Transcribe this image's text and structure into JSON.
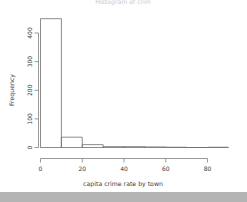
{
  "figure": {
    "background_color": "#ffffff",
    "footer_band_color": "#b4b4b4",
    "axis_color": "#808080",
    "bar_outline_color": "#6e6e6e",
    "title_clipped": "Histogram of crim"
  },
  "chart_data": {
    "type": "bar",
    "title": "Histogram of crim",
    "xlabel": "capita crime rate by town",
    "ylabel": "Frequency",
    "grid": false,
    "legend": null,
    "bin_width": 10,
    "xlim": [
      0,
      90
    ],
    "ylim": [
      0,
      460
    ],
    "xticks": [
      0,
      20,
      40,
      60,
      80
    ],
    "xtick_labels": [
      "0",
      "20",
      "40",
      "60",
      "80"
    ],
    "yticks": [
      0,
      100,
      200,
      300,
      400
    ],
    "ytick_labels": [
      "0",
      "100",
      "200",
      "300",
      "400"
    ],
    "categories": [
      "0-10",
      "10-20",
      "20-30",
      "30-40",
      "40-50",
      "50-60",
      "60-70",
      "70-80",
      "80-90"
    ],
    "bin_edges": [
      0,
      10,
      20,
      30,
      40,
      50,
      60,
      70,
      80,
      90
    ],
    "values": [
      450,
      36,
      10,
      3,
      3,
      2,
      1,
      0,
      1
    ]
  },
  "axis_labels": {
    "x_title": "capita crime rate by town",
    "y_title": "Frequency"
  }
}
